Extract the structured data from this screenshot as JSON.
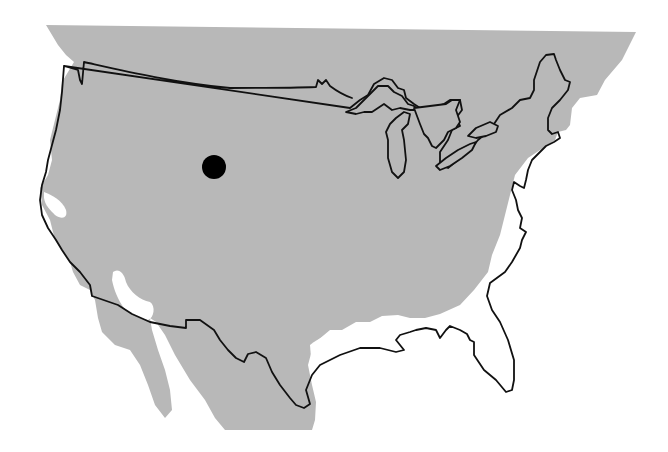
{
  "map": {
    "subject": "Contiguous United States outline with shaded distribution range",
    "colors": {
      "background": "#ffffff",
      "shaded_region": "#b8b8b8",
      "outline": "#111111",
      "marker": "#000000"
    },
    "layers": [
      {
        "name": "shaded-range",
        "description": "Gray shaded region covering most of the interior US, southern Canada and northern Mexico"
      },
      {
        "name": "us-outline",
        "description": "Black outline of contiguous US borders including Great Lakes"
      },
      {
        "name": "location-marker",
        "description": "Solid black dot in the northern Great Plains / Wyoming–Montana area"
      }
    ],
    "marker": {
      "cx": 214,
      "cy": 167,
      "r": 12
    }
  }
}
